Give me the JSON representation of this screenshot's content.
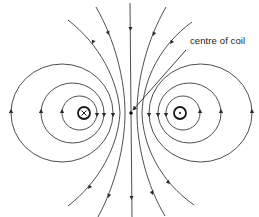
{
  "diagram": {
    "label": "centre of coil",
    "coils": [
      {
        "side": "left",
        "symbol": "cross",
        "glyph": "x",
        "meaning": "current into page",
        "cx": 84,
        "cy": 113
      },
      {
        "side": "right",
        "symbol": "dot",
        "glyph": "•",
        "meaning": "current out of page",
        "cx": 180,
        "cy": 113
      }
    ],
    "centre_point": {
      "cx": 131,
      "cy": 113
    },
    "closed_loops_left": 3,
    "closed_loops_right": 3,
    "open_field_lines": 5,
    "field_direction": "downward through centre of coil",
    "colors": {
      "line": "#3a3a3a",
      "background": "#ffffff"
    }
  }
}
